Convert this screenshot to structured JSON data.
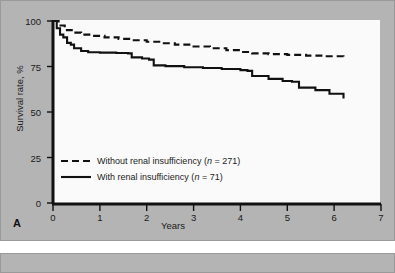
{
  "figure": {
    "panel_letter": "A",
    "background_color": "#b4b4b4",
    "plot_background_color": "#fafafa",
    "line_color": "#111111"
  },
  "chart_data": {
    "type": "line",
    "title": "",
    "xlabel": "Years",
    "ylabel": "Survival rate, %",
    "xlim": [
      0,
      7
    ],
    "ylim": [
      0,
      100
    ],
    "xticks": [
      0,
      1,
      2,
      3,
      4,
      5,
      6,
      7
    ],
    "xtick_labels": [
      "0",
      "1",
      "2",
      "3",
      "4",
      "5",
      "6",
      "7"
    ],
    "yticks": [
      0,
      25,
      50,
      75,
      100
    ],
    "ytick_labels": [
      "0",
      "25",
      "50",
      "75",
      "100"
    ],
    "grid": false,
    "legend_position": "lower-left-inside",
    "series": [
      {
        "name": "Without renal insufficiency (n = 271)",
        "label_prefix": "Without renal insufficiency (",
        "label_n": "n",
        "label_suffix": " = 271)",
        "style": "dashed",
        "n": 271,
        "points": [
          [
            0.0,
            100.0
          ],
          [
            0.12,
            97.5
          ],
          [
            0.25,
            95.0
          ],
          [
            0.4,
            93.6
          ],
          [
            0.6,
            92.5
          ],
          [
            0.85,
            91.8
          ],
          [
            1.1,
            91.0
          ],
          [
            1.4,
            90.2
          ],
          [
            1.7,
            89.4
          ],
          [
            2.0,
            88.6
          ],
          [
            2.3,
            87.8
          ],
          [
            2.6,
            87.0
          ],
          [
            3.0,
            86.0
          ],
          [
            3.35,
            85.0
          ],
          [
            3.7,
            84.0
          ],
          [
            4.0,
            83.0
          ],
          [
            4.25,
            82.2
          ],
          [
            4.6,
            81.8
          ],
          [
            5.0,
            81.4
          ],
          [
            5.4,
            81.0
          ],
          [
            5.8,
            80.6
          ],
          [
            6.2,
            80.4
          ]
        ]
      },
      {
        "name": "With renal insufficiency (n = 71)",
        "label_prefix": "With renal insufficiency (",
        "label_n": "n",
        "label_suffix": " = 71)",
        "style": "solid",
        "n": 71,
        "points": [
          [
            0.0,
            100.0
          ],
          [
            0.08,
            96.0
          ],
          [
            0.15,
            92.5
          ],
          [
            0.22,
            91.0
          ],
          [
            0.3,
            88.0
          ],
          [
            0.38,
            87.0
          ],
          [
            0.45,
            85.0
          ],
          [
            0.6,
            83.5
          ],
          [
            0.75,
            82.8
          ],
          [
            1.0,
            82.6
          ],
          [
            1.35,
            82.4
          ],
          [
            1.6,
            82.2
          ],
          [
            1.68,
            80.0
          ],
          [
            1.9,
            79.4
          ],
          [
            2.05,
            78.8
          ],
          [
            2.15,
            75.6
          ],
          [
            2.4,
            75.2
          ],
          [
            2.8,
            74.6
          ],
          [
            3.2,
            74.2
          ],
          [
            3.6,
            73.6
          ],
          [
            4.0,
            73.0
          ],
          [
            4.15,
            72.6
          ],
          [
            4.25,
            69.8
          ],
          [
            4.6,
            68.2
          ],
          [
            4.9,
            67.0
          ],
          [
            5.1,
            66.6
          ],
          [
            5.25,
            63.4
          ],
          [
            5.6,
            62.0
          ],
          [
            5.9,
            60.0
          ],
          [
            6.2,
            57.4
          ]
        ]
      }
    ]
  }
}
